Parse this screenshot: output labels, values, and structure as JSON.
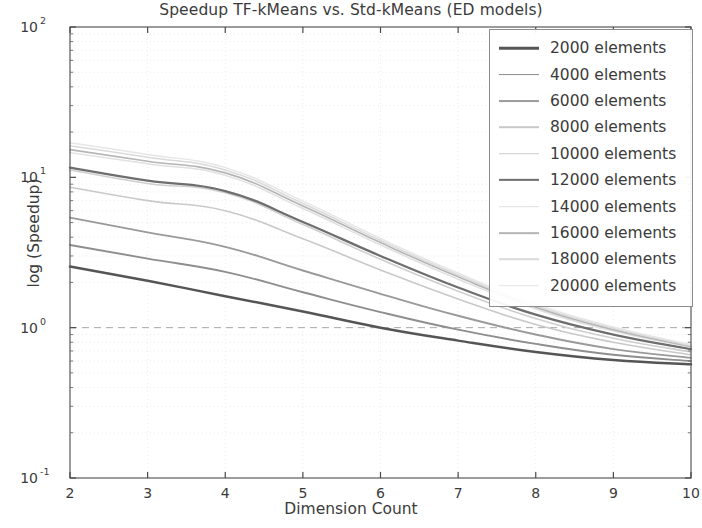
{
  "chart_data": {
    "type": "line",
    "title": "Speedup TF-kMeans vs. Std-kMeans (ED models)",
    "xlabel": "Dimension Count",
    "ylabel": "log (Speedup)",
    "yscale": "log",
    "xscale": "linear",
    "xlim": [
      2,
      10
    ],
    "ylim": [
      0.1,
      100
    ],
    "xticks": [
      "2",
      "3",
      "4",
      "5",
      "6",
      "7",
      "8",
      "9",
      "10"
    ],
    "xtick_values": [
      2,
      3,
      4,
      5,
      6,
      7,
      8,
      9,
      10
    ],
    "ytick_labels": [
      "10",
      "10",
      "10",
      "10"
    ],
    "ytick_exponents": [
      "2",
      "1",
      "0",
      "-1"
    ],
    "ytick_values": [
      100,
      10,
      1,
      0.1
    ],
    "grid": true,
    "grid_style": "dashed-minor",
    "reference_line": {
      "y": 1,
      "style": "dashed"
    },
    "legend_position": "upper right",
    "x": [
      2,
      3,
      4,
      5,
      6,
      7,
      8,
      9,
      10
    ],
    "series": [
      {
        "name": "2000 elements",
        "color": "#555555",
        "width": 2.5,
        "values": [
          2.55,
          2.05,
          1.62,
          1.28,
          1.0,
          0.82,
          0.69,
          0.61,
          0.57
        ]
      },
      {
        "name": "4000 elements",
        "color": "#8e8e8e",
        "width": 1.9,
        "values": [
          3.55,
          2.88,
          2.35,
          1.72,
          1.27,
          0.97,
          0.78,
          0.66,
          0.6
        ]
      },
      {
        "name": "6000 elements",
        "color": "#9a9a9a",
        "width": 1.9,
        "values": [
          5.4,
          4.3,
          3.45,
          2.4,
          1.68,
          1.2,
          0.9,
          0.72,
          0.63
        ]
      },
      {
        "name": "8000 elements",
        "color": "#c9c9c9",
        "width": 1.6,
        "values": [
          8.6,
          7.0,
          6.0,
          3.9,
          2.42,
          1.55,
          1.05,
          0.8,
          0.66
        ]
      },
      {
        "name": "10000 elements",
        "color": "#cfcfcf",
        "width": 1.6,
        "values": [
          11.2,
          9.1,
          7.9,
          4.85,
          2.85,
          1.75,
          1.15,
          0.85,
          0.69
        ]
      },
      {
        "name": "12000 elements",
        "color": "#6e6e6e",
        "width": 2.3,
        "values": [
          11.6,
          9.5,
          8.1,
          5.05,
          3.0,
          1.85,
          1.22,
          0.9,
          0.72
        ]
      },
      {
        "name": "14000 elements",
        "color": "#e0e0e0",
        "width": 1.5,
        "values": [
          14.6,
          12.3,
          10.3,
          6.2,
          3.55,
          2.1,
          1.33,
          0.95,
          0.74
        ]
      },
      {
        "name": "16000 elements",
        "color": "#b5b5b5",
        "width": 1.7,
        "values": [
          15.3,
          12.8,
          10.7,
          6.45,
          3.68,
          2.18,
          1.37,
          0.97,
          0.75
        ]
      },
      {
        "name": "18000 elements",
        "color": "#dadada",
        "width": 1.5,
        "values": [
          16.2,
          13.6,
          11.2,
          6.7,
          3.8,
          2.24,
          1.4,
          0.99,
          0.76
        ]
      },
      {
        "name": "20000 elements",
        "color": "#e6e6e6",
        "width": 1.5,
        "values": [
          17.0,
          14.2,
          11.6,
          6.95,
          3.92,
          2.3,
          1.44,
          1.01,
          0.77
        ]
      }
    ]
  },
  "axes": {
    "title": "Speedup TF-kMeans vs. Std-kMeans (ED models)",
    "xlabel": "Dimension Count",
    "ylabel": "log (Speedup)"
  },
  "legend": {
    "entries": [
      {
        "label": "2000 elements"
      },
      {
        "label": "4000 elements"
      },
      {
        "label": "6000 elements"
      },
      {
        "label": "8000 elements"
      },
      {
        "label": "10000 elements"
      },
      {
        "label": "12000 elements"
      },
      {
        "label": "14000 elements"
      },
      {
        "label": "16000 elements"
      },
      {
        "label": "18000 elements"
      },
      {
        "label": "20000 elements"
      }
    ]
  }
}
